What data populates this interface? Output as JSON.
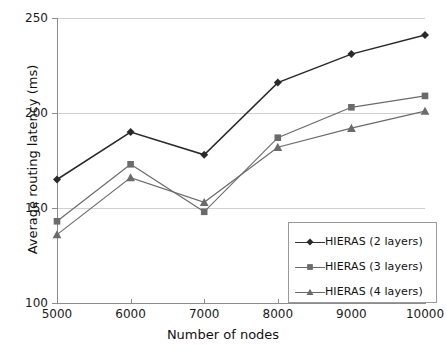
{
  "chart_data": {
    "type": "line",
    "title": "",
    "xlabel": "Number of nodes",
    "ylabel": "Average routing latency (ms)",
    "categories": [
      5000,
      6000,
      7000,
      8000,
      9000,
      10000
    ],
    "xtick_labels": [
      "5000",
      "6000",
      "7000",
      "8000",
      "9000",
      "10000"
    ],
    "ytick_labels": [
      "100",
      "150",
      "200",
      "250"
    ],
    "ytick_values": [
      100,
      150,
      200,
      250
    ],
    "xlim": [
      5000,
      10000
    ],
    "ylim": [
      100,
      250
    ],
    "grid": "horizontal",
    "legend_position": "bottom-right-inside",
    "series": [
      {
        "name": "HIERAS (2 layers)",
        "marker": "diamond",
        "color": "#2a2a2a",
        "values": [
          165,
          190,
          178,
          216,
          231,
          241
        ]
      },
      {
        "name": "HIERAS (3 layers)",
        "marker": "square",
        "color": "#6b6b6b",
        "values": [
          143,
          173,
          148,
          187,
          203,
          209
        ]
      },
      {
        "name": "HIERAS (4 layers)",
        "marker": "triangle",
        "color": "#6b6b6b",
        "values": [
          136,
          166,
          153,
          182,
          192,
          201
        ]
      }
    ]
  },
  "axes": {
    "x_title": "Number of nodes",
    "y_title": "Average routing latency (ms)",
    "y_ticks": [
      {
        "label": "250",
        "value": 250
      },
      {
        "label": "200",
        "value": 200
      },
      {
        "label": "150",
        "value": 150
      },
      {
        "label": "100",
        "value": 100
      }
    ],
    "x_ticks": [
      {
        "label": "5000",
        "value": 5000
      },
      {
        "label": "6000",
        "value": 6000
      },
      {
        "label": "7000",
        "value": 7000
      },
      {
        "label": "8000",
        "value": 8000
      },
      {
        "label": "9000",
        "value": 9000
      },
      {
        "label": "10000",
        "value": 10000
      }
    ]
  },
  "legend": {
    "entries": [
      {
        "label": "HIERAS (2 layers)",
        "marker": "diamond",
        "color": "#2a2a2a"
      },
      {
        "label": "HIERAS (3 layers)",
        "marker": "square",
        "color": "#6b6b6b"
      },
      {
        "label": "HIERAS (4 layers)",
        "marker": "triangle",
        "color": "#6b6b6b"
      }
    ]
  },
  "colors": {
    "grid": "#d0d0d0",
    "axis": "#8c8c8c",
    "text": "#1a1a1a",
    "series_dark": "#2a2a2a",
    "series_gray": "#6b6b6b"
  }
}
